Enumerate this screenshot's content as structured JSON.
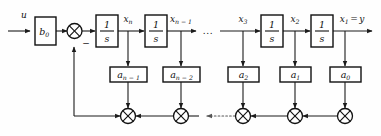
{
  "diagram": {
    "ink_color": "#111111",
    "background_color": "#fefefe",
    "input_label": "u",
    "gain_block_label": "b",
    "gain_block_sub": "0",
    "integrator_numerator": "1",
    "integrator_denominator": "s",
    "ellipsis": "...",
    "minus_sign": "−",
    "output_equation_label": "=",
    "output_label": "y",
    "signals": [
      {
        "base": "x",
        "sub": "n",
        "name": "signal-x-n"
      },
      {
        "base": "x",
        "sub": "n − 1",
        "name": "signal-x-n-minus-1"
      },
      {
        "base": "x",
        "sub": "3",
        "name": "signal-x-3"
      },
      {
        "base": "x",
        "sub": "2",
        "name": "signal-x-2"
      },
      {
        "base": "x",
        "sub": "1",
        "name": "signal-x-1"
      }
    ],
    "coefficients": [
      {
        "base": "a",
        "sub": "n − 1",
        "name": "coefficient-a-n-minus-1"
      },
      {
        "base": "a",
        "sub": "n − 2",
        "name": "coefficient-a-n-minus-2"
      },
      {
        "base": "a",
        "sub": "2",
        "name": "coefficient-a-2"
      },
      {
        "base": "a",
        "sub": "1",
        "name": "coefficient-a-1"
      },
      {
        "base": "a",
        "sub": "0",
        "name": "coefficient-a-0"
      }
    ],
    "integrator_count": 4,
    "summing_junction_count": 6
  }
}
